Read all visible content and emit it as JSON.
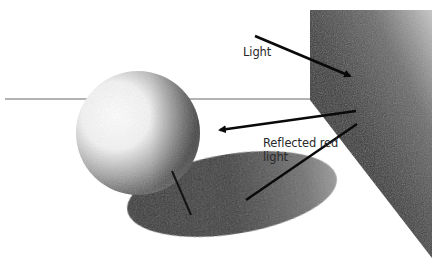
{
  "figure": {
    "labels": {
      "light": "Light",
      "reflected_line1": "Reflected red",
      "reflected_line2": "light"
    },
    "colors": {
      "background": "#ffffff",
      "wall_dark": "#2e2e2e",
      "wall_light": "#bdbdbd",
      "sphere_highlight": "#ffffff",
      "sphere_shadow": "#3a3a3a",
      "cast_shadow_dark": "#2a2a2a",
      "cast_shadow_light": "#8a8a8a",
      "horizon_line": "#9a9a9a",
      "arrow": "#0a0a0a",
      "text": "#2a2a2a"
    },
    "elements": {
      "horizon": {
        "y": 99,
        "x_start": 5,
        "x_end": 312
      },
      "sphere": {
        "cx": 138,
        "cy": 133,
        "r": 62
      },
      "cast_shadow": {
        "cx": 232,
        "cy": 194,
        "rx": 106,
        "ry": 40,
        "rotate": -9
      },
      "wall": {
        "points": "310,10 432,10 432,258 310,100"
      },
      "arrows": [
        {
          "name": "light-arrow",
          "x1": 255,
          "y1": 36,
          "x2": 352,
          "y2": 77
        },
        {
          "name": "reflected-arrow",
          "x1": 356,
          "y1": 111,
          "x2": 218,
          "y2": 130
        },
        {
          "name": "reflected-line",
          "x1": 357,
          "y1": 124,
          "x2": 246,
          "y2": 200
        }
      ],
      "tick": {
        "x1": 172,
        "y1": 171,
        "x2": 191,
        "y2": 215
      }
    }
  }
}
